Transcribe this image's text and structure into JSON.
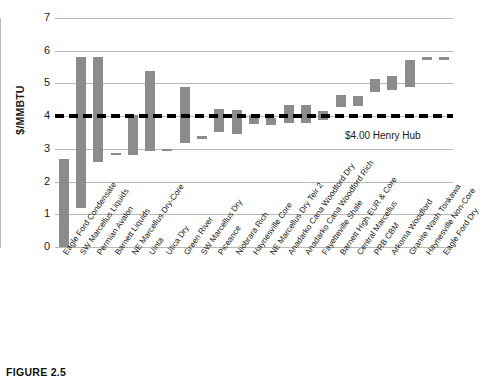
{
  "chart_data": {
    "type": "bar",
    "title": "",
    "subtitle": "",
    "xlabel": "",
    "ylabel": "$/MMBTU",
    "ylim": [
      0,
      7
    ],
    "yticks": [
      0,
      1,
      2,
      3,
      4,
      5,
      6,
      7
    ],
    "grid": true,
    "legend": null,
    "bar_style": "floating range bars (low-to-high breakeven cost range)",
    "bar_color": "#8c8c8c",
    "categories": [
      "Eagle Ford Condensate",
      "SW Marcellus Liquids",
      "Permian Avalon",
      "Barnett Liquids",
      "NE Marcellus Dry-Core",
      "Uinta",
      "Utica Dry",
      "Green River",
      "SW Marcellus Dry",
      "Piceance",
      "Niobrara Rich",
      "Haynesville Core",
      "NE Marcellus Dry Teir 2",
      "Anadarko Cana Woodford Dry",
      "Anadarko Cana Woodford Rich",
      "Fayetteville Shale",
      "Barnett High EUR & Core",
      "Central Marcellus",
      "PRB CBM",
      "Arkoma Woodford",
      "Granite Wash Tonkawa",
      "Haynesville Non-Core",
      "Eagle Ford Dry"
    ],
    "series": [
      {
        "name": "Breakeven cost range ($/MMBTU)",
        "low": [
          0.0,
          1.2,
          2.6,
          2.8,
          2.8,
          2.92,
          2.95,
          3.18,
          3.3,
          3.5,
          3.45,
          3.75,
          3.72,
          3.8,
          3.78,
          3.88,
          4.28,
          4.3,
          4.75,
          4.8,
          4.9,
          5.72,
          5.72
        ],
        "high": [
          2.7,
          5.8,
          5.8,
          2.88,
          4.05,
          5.38,
          3.0,
          4.88,
          3.38,
          4.22,
          4.18,
          4.02,
          3.95,
          4.35,
          4.35,
          4.15,
          4.65,
          4.62,
          5.15,
          5.22,
          5.72,
          5.82,
          5.82
        ]
      }
    ],
    "reference_line": {
      "value": 4.0,
      "label": "$4.00 Henry Hub",
      "style": "dashed",
      "color": "#000000"
    }
  },
  "caption": {
    "text": "FIGURE 2.5"
  }
}
